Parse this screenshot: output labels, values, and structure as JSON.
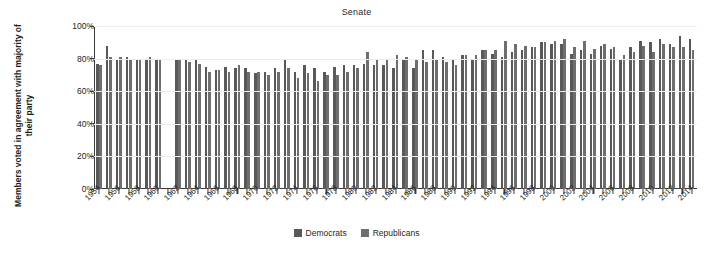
{
  "chart_data": {
    "type": "bar",
    "title": "Senate",
    "xlabel": "",
    "ylabel": "Members voted in agreement with majority of their party",
    "ylim": [
      0,
      100
    ],
    "yticks": [
      "0%",
      "20%",
      "40%",
      "60%",
      "80%",
      "100%"
    ],
    "ytick_values": [
      0,
      20,
      40,
      60,
      80,
      100
    ],
    "grid": true,
    "legend_position": "bottom-center",
    "x": [
      1954,
      1955,
      1956,
      1957,
      1958,
      1959,
      1960,
      1961,
      1962,
      1963,
      1964,
      1965,
      1966,
      1967,
      1968,
      1969,
      1970,
      1971,
      1972,
      1973,
      1974,
      1975,
      1976,
      1977,
      1978,
      1979,
      1980,
      1981,
      1982,
      1983,
      1984,
      1985,
      1986,
      1987,
      1988,
      1989,
      1990,
      1991,
      1992,
      1993,
      1994,
      1995,
      1996,
      1997,
      1998,
      1999,
      2000,
      2001,
      2002,
      2003,
      2004,
      2005,
      2006,
      2007,
      2008,
      2009,
      2010,
      2011,
      2012,
      2013,
      2014
    ],
    "xtick_labels": [
      "1954",
      "1956",
      "1958",
      "1960",
      "1962",
      "1964",
      "1966",
      "1968",
      "1970",
      "1972",
      "1974",
      "1976",
      "1978",
      "1980",
      "1982",
      "1984",
      "1986",
      "1988",
      "1990",
      "1992",
      "1994",
      "1996",
      "1998",
      "2000",
      "2002",
      "2004",
      "2006",
      "2008",
      "2010",
      "2012",
      "2014"
    ],
    "series": [
      {
        "name": "Democrats",
        "color": "#595959",
        "values": [
          77,
          88,
          80,
          81,
          79,
          80,
          79,
          null,
          80,
          80,
          79,
          75,
          73,
          75,
          74,
          74,
          71,
          72,
          74,
          79,
          72,
          76,
          74,
          72,
          75,
          76,
          76,
          77,
          76,
          76,
          74,
          79,
          74,
          85,
          85,
          81,
          80,
          82,
          79,
          85,
          83,
          81,
          84,
          85,
          87,
          90,
          89,
          89,
          83,
          85,
          83,
          88,
          86,
          80,
          87,
          91,
          90,
          92,
          89,
          94,
          92
        ],
        "unit": "%"
      },
      {
        "name": "Republicans",
        "color": "#6e6e6e",
        "values": [
          76,
          81,
          81,
          79,
          79,
          81,
          80,
          null,
          80,
          78,
          77,
          72,
          73,
          72,
          76,
          72,
          72,
          70,
          72,
          74,
          68,
          71,
          66,
          70,
          70,
          72,
          74,
          84,
          80,
          79,
          82,
          81,
          79,
          78,
          80,
          78,
          76,
          82,
          82,
          85,
          85,
          91,
          89,
          88,
          87,
          90,
          91,
          92,
          87,
          91,
          86,
          89,
          87,
          82,
          84,
          88,
          84,
          89,
          87,
          87,
          85
        ],
        "unit": "%"
      }
    ]
  },
  "legend": {
    "items": [
      {
        "label": "Democrats",
        "key": "dem"
      },
      {
        "label": "Republicans",
        "key": "rep"
      }
    ]
  }
}
